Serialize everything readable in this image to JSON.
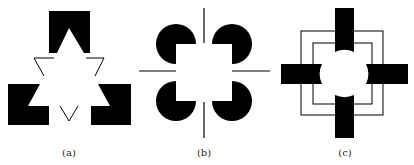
{
  "figures": [
    {
      "id": "a",
      "caption": "(a)",
      "description": "Kanizsa illusory triangle formed by black notched blocks and line segments"
    },
    {
      "id": "b",
      "caption": "(b)",
      "description": "Illusory square formed by four pac-man disks and line segments"
    },
    {
      "id": "c",
      "caption": "(c)",
      "description": "Illusory circle formed by four black bars with concave ends over nested squares"
    }
  ],
  "colors": {
    "ink": "#000000",
    "background": "#ffffff"
  }
}
